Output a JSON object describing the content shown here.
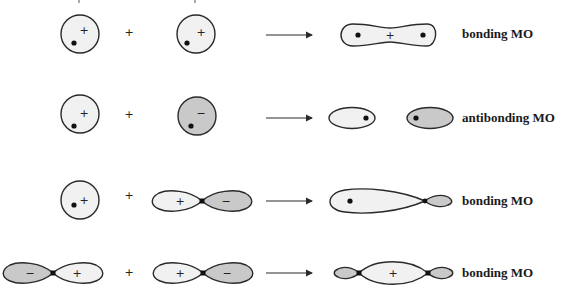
{
  "colors": {
    "positive_fill": "#f1f1f1",
    "negative_fill": "#c9c9c9",
    "stroke": "#2a2a2a",
    "nucleus": "#111111",
    "label": "#1a1a1a"
  },
  "operator_plus": "+",
  "rows": [
    {
      "id": "row1",
      "left_orbital": "s (+)",
      "right_orbital": "s (+)",
      "signs": {
        "left": "+",
        "right": "+",
        "result": "+"
      },
      "result_label": "bonding MO"
    },
    {
      "id": "row2",
      "left_orbital": "s (+)",
      "right_orbital": "s (−)",
      "signs": {
        "left": "+",
        "right": "−"
      },
      "result_label": "antibonding MO"
    },
    {
      "id": "row3",
      "left_orbital": "s (+)",
      "right_orbital": "p (+/−)",
      "signs": {
        "left": "+",
        "right_pos": "+",
        "right_neg": "−"
      },
      "result_label": "bonding MO"
    },
    {
      "id": "row4",
      "left_orbital": "p (−/+)",
      "right_orbital": "p (+/−)",
      "signs": {
        "left_neg": "−",
        "left_pos": "+",
        "right_pos": "+",
        "right_neg": "−",
        "result": "+"
      },
      "result_label": "bonding MO"
    }
  ]
}
